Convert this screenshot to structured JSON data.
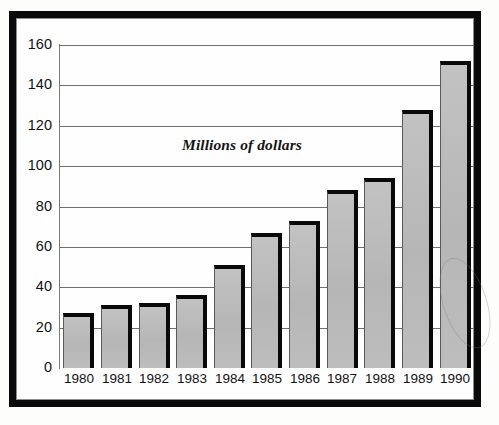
{
  "document": {
    "kind": "scanned-bar-chart",
    "frame_color": "#0a0a0a",
    "page_background": "#ffffff"
  },
  "chart_data": {
    "type": "bar",
    "title": "",
    "annotation": "Millions of dollars",
    "xlabel": "",
    "ylabel": "",
    "categories": [
      "1980",
      "1981",
      "1982",
      "1983",
      "1984",
      "1985",
      "1986",
      "1987",
      "1988",
      "1989",
      "1990"
    ],
    "values": [
      27,
      31,
      32,
      36,
      51,
      67,
      73,
      88,
      94,
      128,
      152
    ],
    "ylim": [
      0,
      160
    ],
    "yticks": [
      "0",
      "20",
      "40",
      "60",
      "80",
      "100",
      "120",
      "140",
      "160"
    ],
    "ytick_values": [
      0,
      20,
      40,
      60,
      80,
      100,
      120,
      140,
      160
    ],
    "grid": "horizontal",
    "legend": "none",
    "bar_fill_color": "#bcbcbc",
    "bar_edge_color": "#090909",
    "gridline_color": "#6f6f6f",
    "units": "Millions of dollars"
  }
}
